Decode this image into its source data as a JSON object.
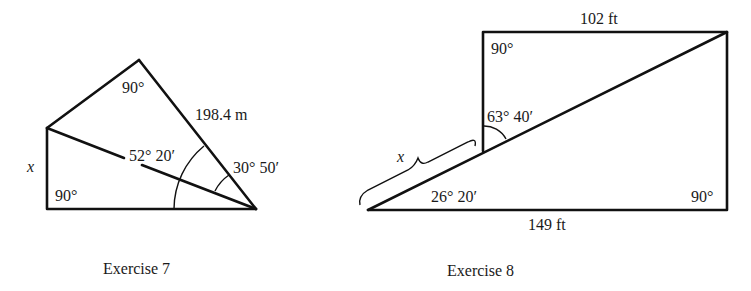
{
  "figures": [
    {
      "id": "exercise-7",
      "caption": "Exercise 7",
      "labels": {
        "top_right_angle": "90°",
        "hypotenuse_length": "198.4 m",
        "inner_angle": "52° 20′",
        "outer_angle": "30° 50′",
        "unknown_side": "x",
        "bottom_right_angle": "90°"
      }
    },
    {
      "id": "exercise-8",
      "caption": "Exercise 8",
      "labels": {
        "top_length": "102 ft",
        "top_left_angle": "90°",
        "upper_angle": "63° 40′",
        "unknown_segment": "x",
        "lower_angle": "26° 20′",
        "bottom_right_angle": "90°",
        "bottom_length": "149 ft"
      }
    }
  ]
}
